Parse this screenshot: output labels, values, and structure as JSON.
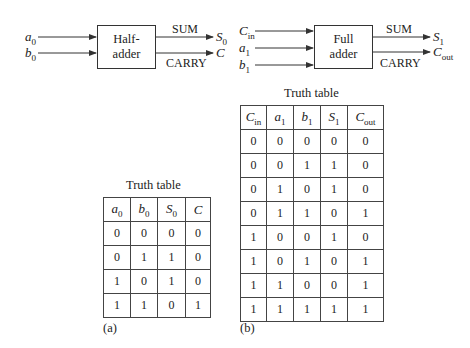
{
  "half_adder": {
    "inputs": [
      "a0",
      "b0"
    ],
    "block_label_line1": "Half-",
    "block_label_line2": "adder",
    "sum_label": "SUM",
    "carry_label": "CARRY",
    "outputs": [
      "S0",
      "C"
    ]
  },
  "full_adder": {
    "inputs": [
      "Cin",
      "a1",
      "b1"
    ],
    "block_label_line1": "Full",
    "block_label_line2": "adder",
    "sum_label": "SUM",
    "carry_label": "CARRY",
    "outputs": [
      "S1",
      "Cout"
    ]
  },
  "truth_table_a": {
    "title": "Truth table",
    "caption": "(a)",
    "headers": [
      "a0",
      "b0",
      "S0",
      "C"
    ],
    "rows": [
      [
        "0",
        "0",
        "0",
        "0"
      ],
      [
        "0",
        "1",
        "1",
        "0"
      ],
      [
        "1",
        "0",
        "1",
        "0"
      ],
      [
        "1",
        "1",
        "0",
        "1"
      ]
    ]
  },
  "truth_table_b": {
    "title": "Truth table",
    "caption": "(b)",
    "headers": [
      "Cin",
      "a1",
      "b1",
      "S1",
      "Cout"
    ],
    "rows": [
      [
        "0",
        "0",
        "0",
        "0",
        "0"
      ],
      [
        "0",
        "0",
        "1",
        "1",
        "0"
      ],
      [
        "0",
        "1",
        "0",
        "1",
        "0"
      ],
      [
        "0",
        "1",
        "1",
        "0",
        "1"
      ],
      [
        "1",
        "0",
        "0",
        "1",
        "0"
      ],
      [
        "1",
        "0",
        "1",
        "0",
        "1"
      ],
      [
        "1",
        "1",
        "0",
        "0",
        "1"
      ],
      [
        "1",
        "1",
        "1",
        "1",
        "1"
      ]
    ]
  }
}
